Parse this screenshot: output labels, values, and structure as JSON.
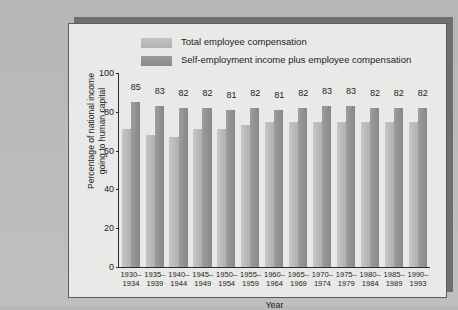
{
  "chart_data": {
    "type": "bar",
    "title": "",
    "xlabel": "Year",
    "ylabel": "Percentage of national income going to human capital",
    "ylabel_line1": "Percentage of national income",
    "ylabel_line2": "going to human capital",
    "ylim": [
      0,
      100
    ],
    "yticks": [
      0,
      20,
      40,
      60,
      80,
      100
    ],
    "grid": false,
    "legend_position": "top-center",
    "categories": [
      "1930–1934",
      "1935–1939",
      "1940–1944",
      "1945–1949",
      "1950–1954",
      "1955–1959",
      "1960–1964",
      "1965–1969",
      "1970–1974",
      "1975–1979",
      "1980–1984",
      "1985–1989",
      "1990–1993"
    ],
    "category_lines": [
      [
        "1930–",
        "1934"
      ],
      [
        "1935–",
        "1939"
      ],
      [
        "1940–",
        "1944"
      ],
      [
        "1945–",
        "1949"
      ],
      [
        "1950–",
        "1954"
      ],
      [
        "1955–",
        "1959"
      ],
      [
        "1960–",
        "1964"
      ],
      [
        "1965–",
        "1969"
      ],
      [
        "1970–",
        "1974"
      ],
      [
        "1975–",
        "1979"
      ],
      [
        "1980–",
        "1984"
      ],
      [
        "1985–",
        "1989"
      ],
      [
        "1990–",
        "1993"
      ]
    ],
    "series": [
      {
        "name": "Total employee compensation",
        "color": "#b8b8b8",
        "labels_shown": false,
        "values": [
          71,
          68,
          67,
          71,
          71,
          73,
          75,
          75,
          75,
          75,
          75,
          75,
          75
        ]
      },
      {
        "name": "Self-employment income plus employee compensation",
        "name_line1": "Self-employment income plus",
        "name_line2": "employee compensation",
        "color": "#939393",
        "labels_shown": true,
        "values": [
          85,
          83,
          82,
          82,
          81,
          82,
          81,
          82,
          83,
          83,
          82,
          82,
          82
        ],
        "labels": [
          "85",
          "83",
          "82",
          "82",
          "81",
          "82",
          "81",
          "82",
          "83",
          "83",
          "82",
          "82",
          "82"
        ]
      }
    ]
  }
}
